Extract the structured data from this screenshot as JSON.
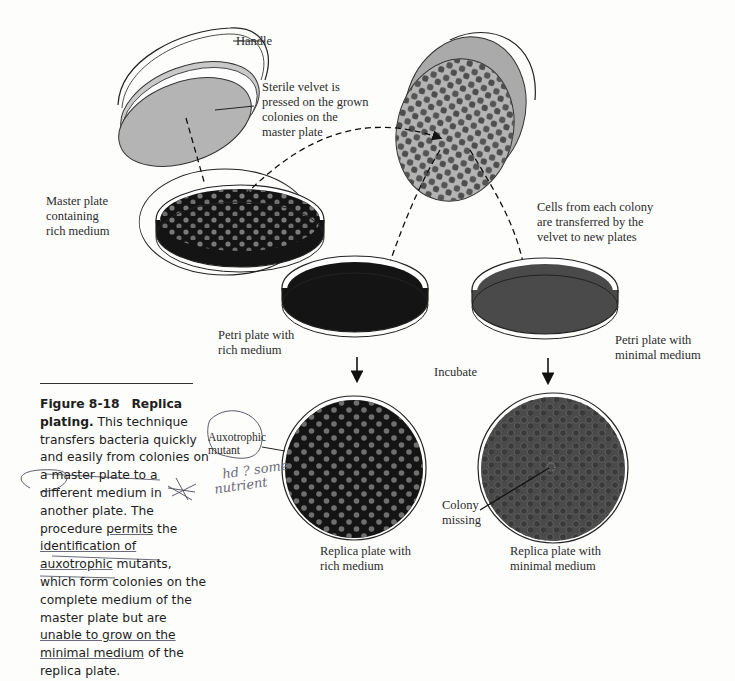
{
  "figure": {
    "number": "Figure 8-18",
    "title": "Replica plating.",
    "caption_parts": [
      "This technique transfers bacteria quickly and easily from colonies on a master plate to a different medium in another plate. The procedure ",
      "permits",
      " the ",
      "identification of",
      " ",
      "auxotrophic",
      " mutants, which form colonies on the complete medium of the master plate but are ",
      "unable to grow on the",
      " ",
      "minimal medium",
      " of the replica plate."
    ]
  },
  "labels": {
    "handle": "Handle",
    "velvet": "Sterile velvet is\npressed on the grown\ncolonies on the\nmaster plate",
    "master_plate": "Master plate\ncontaining\nrich medium",
    "cells_transfer": "Cells from each colony\nare transferred by the\nvelvet to new plates",
    "petri_rich": "Petri plate with\nrich medium",
    "petri_minimal": "Petri plate with\nminimal medium",
    "incubate": "Incubate",
    "auxotrophic_mutant": "Auxotrophic\nmutant",
    "colony_missing": "Colony\nmissing",
    "replica_rich": "Replica plate with\nrich medium",
    "replica_minimal": "Replica plate with\nminimal medium"
  },
  "handwritten": {
    "note_line1": "hd ? some",
    "note_line2": "nutrient",
    "star_mark": "✲"
  },
  "colors": {
    "rich_medium": "#141414",
    "minimal_medium": "#4a4a4a",
    "velvet": "#b4b4b4",
    "colony_on_rich": "#7a7a7a",
    "colony_on_velvet": "#555555"
  }
}
